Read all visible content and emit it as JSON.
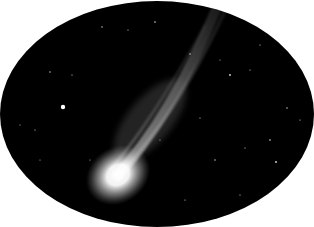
{
  "image": {
    "description": "Black-and-white photograph of a comet with a bright coma and long streaming ion tail against a starry sky, cropped in an oval frame",
    "subject": "comet",
    "frame_shape": "oval",
    "colors": {
      "background": "#ffffff",
      "sky": "#000000",
      "coma": "#ffffff",
      "tail": "#bdbdbd",
      "stars": "#e0e0e0"
    }
  }
}
